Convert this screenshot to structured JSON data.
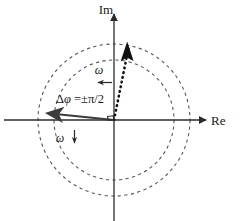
{
  "figure": {
    "width": 240,
    "height": 221,
    "background": "#ffffff"
  },
  "axes": {
    "imaginary": {
      "label": "Im",
      "icon": "axis-arrow-up-icon",
      "color": "#2b2b2b"
    },
    "real": {
      "label": "Re",
      "icon": "axis-arrow-right-icon",
      "color": "#2b2b2b"
    },
    "origin": {
      "x": 114,
      "y": 120
    }
  },
  "circles": [
    {
      "name": "inner-circle",
      "radius": 60,
      "style": "dashed",
      "color": "#555555"
    },
    {
      "name": "outer-circle",
      "radius": 76,
      "style": "dashed",
      "color": "#555555"
    }
  ],
  "vectors": {
    "dotted": {
      "name": "dotted-phasor",
      "style": "dotted",
      "color": "#111111",
      "tip": {
        "x": 127,
        "y": 41
      }
    },
    "solid": {
      "name": "solid-phasor",
      "style": "solid",
      "color": "#3c3c3c",
      "tip": {
        "x": 42,
        "y": 112
      }
    }
  },
  "annotations": {
    "phase_shift": {
      "prefix": "Δ",
      "symbol": "φ",
      "equals": "=±π/2",
      "full": "Δφ =±π/2"
    },
    "right_angle": {
      "name": "right-angle-marker",
      "value": "90°"
    },
    "omega_upper": {
      "label": "ω",
      "arrow": "arrow-left-icon",
      "direction": "left"
    },
    "omega_lower": {
      "label": "ω",
      "arrow": "arrow-down-icon",
      "direction": "down"
    }
  },
  "colors": {
    "axis": "#2b2b2b",
    "dashed_circle": "#555555",
    "dotted_vector": "#111111",
    "solid_vector": "#3c3c3c",
    "text": "#1a1a1a"
  }
}
